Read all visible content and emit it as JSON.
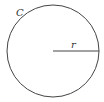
{
  "diagram": {
    "type": "circle-with-radius",
    "labels": {
      "circle": "C",
      "radius": "r"
    },
    "stroke_color": "#444444",
    "background_color": "#ffffff"
  }
}
